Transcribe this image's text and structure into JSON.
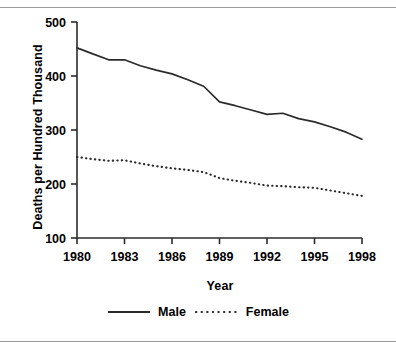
{
  "chart_data": {
    "type": "line",
    "title": "",
    "xlabel": "Year",
    "ylabel": "Deaths per Hundred Thousand",
    "xlim": [
      1980,
      1998
    ],
    "ylim": [
      100,
      500
    ],
    "grid": false,
    "legend_position": "bottom",
    "x_tick_labels": [
      "1980",
      "1983",
      "1986",
      "1989",
      "1992",
      "1995",
      "1998"
    ],
    "x_tick_values": [
      1980,
      1983,
      1986,
      1989,
      1992,
      1995,
      1998
    ],
    "y_tick_labels": [
      "100",
      "200",
      "300",
      "400",
      "500"
    ],
    "y_tick_values": [
      100,
      200,
      300,
      400,
      500
    ],
    "x": [
      1980,
      1981,
      1982,
      1983,
      1984,
      1985,
      1986,
      1987,
      1988,
      1989,
      1990,
      1991,
      1992,
      1993,
      1994,
      1995,
      1996,
      1997,
      1998
    ],
    "series": [
      {
        "name": "Male",
        "style": "solid",
        "color": "#2b2b2b",
        "values": [
          452,
          441,
          430,
          430,
          419,
          411,
          404,
          393,
          381,
          352,
          345,
          337,
          329,
          331,
          321,
          315,
          306,
          296,
          283
        ]
      },
      {
        "name": "Female",
        "style": "dotted",
        "color": "#2b2b2b",
        "values": [
          250,
          246,
          243,
          244,
          238,
          233,
          229,
          226,
          222,
          211,
          206,
          202,
          197,
          196,
          194,
          193,
          188,
          183,
          178
        ]
      }
    ]
  },
  "legend": {
    "male_label": "Male",
    "female_label": "Female"
  },
  "axes": {
    "x_title": "Year",
    "y_title": "Deaths per Hundred Thousand"
  }
}
